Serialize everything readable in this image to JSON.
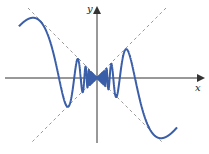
{
  "figure": {
    "x_label": "x",
    "y_label": "y",
    "colors": {
      "curve": "#3a5ea8",
      "axes": "#333333",
      "envelope": "#999999",
      "background": "#ffffff"
    },
    "origin_px": [
      97,
      78
    ],
    "function": {
      "form": "y = x * cos(A / x)",
      "A": 179,
      "x_range_px": [
        -78,
        80
      ]
    },
    "envelopes": [
      "y = x",
      "y = -x"
    ]
  }
}
